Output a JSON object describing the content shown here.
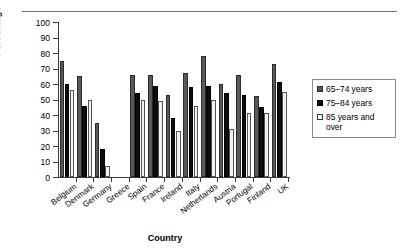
{
  "chart_data": {
    "type": "bar",
    "title": "",
    "xlabel": "Country",
    "ylabel": "Percentage",
    "ylim": [
      0,
      100
    ],
    "ytick_step": 10,
    "ytick_labels": [
      "0",
      "10",
      "20",
      "30",
      "40",
      "50",
      "60",
      "70",
      "80",
      "90",
      "100"
    ],
    "grid": false,
    "legend_position": "right",
    "categories": [
      "Belgium",
      "Denmark",
      "Germany",
      "Greece",
      "Spain",
      "France",
      "Ireland",
      "Italy",
      "Netherlands",
      "Austria",
      "Portugal",
      "Finland",
      "UK"
    ],
    "series": [
      {
        "name": "65–74 years",
        "color": "#595959",
        "values": [
          75,
          65,
          35,
          0,
          66,
          66,
          53,
          67,
          78,
          60,
          66,
          52,
          73
        ]
      },
      {
        "name": "75–84 years",
        "color": "#0d0d0d",
        "values": [
          60,
          46,
          18,
          0,
          54,
          59,
          38,
          58,
          59,
          54,
          53,
          45,
          61
        ]
      },
      {
        "name": "85 years and over",
        "color": "#f2f2f2",
        "values": [
          56,
          50,
          7,
          0,
          50,
          49,
          30,
          46,
          50,
          31,
          41,
          41,
          55
        ]
      }
    ]
  },
  "legend": {
    "entries": [
      {
        "label": "65–74 years"
      },
      {
        "label": "75–84 years"
      },
      {
        "label": "85 years and over"
      }
    ]
  },
  "axes": {
    "x_title": "Country",
    "y_title": "Percentage"
  }
}
